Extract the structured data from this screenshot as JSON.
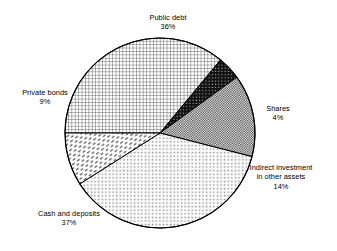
{
  "chart_data": {
    "type": "pie",
    "title": "",
    "subtitle": "",
    "xlabel": "",
    "ylabel": "",
    "legend_position": "none",
    "grid": false,
    "units": "percent",
    "total": 100,
    "categories": [
      "Public debt",
      "Shares",
      "Indirect investment in other assets",
      "Cash and deposits",
      "Private bonds"
    ],
    "values": [
      36,
      4,
      14,
      37,
      9
    ],
    "slices": [
      {
        "id": "public-debt",
        "label": "Public debt",
        "label_lines": [
          "Public debt",
          "36%"
        ],
        "value": 36,
        "value_text": "36%",
        "start_angle_deg": 180,
        "end_angle_deg": 309.6,
        "pattern": "fine-grid-crosshatch",
        "fill": "#ffffff",
        "stroke": "#000000"
      },
      {
        "id": "shares",
        "label": "Shares",
        "label_lines": [
          "Shares",
          "4%"
        ],
        "value": 4,
        "value_text": "4%",
        "start_angle_deg": 309.6,
        "end_angle_deg": 324.0,
        "pattern": "dark-dotted",
        "fill": "#1a1a1a",
        "stroke": "#000000"
      },
      {
        "id": "indirect-investment",
        "label": "Indirect investment in other assets",
        "label_lines": [
          "Indirect investment",
          "in other assets",
          "14%"
        ],
        "value": 14,
        "value_text": "14%",
        "start_angle_deg": 324.0,
        "end_angle_deg": 374.4,
        "pattern": "checkerboard-50",
        "fill": "#7a7a7a",
        "stroke": "#000000"
      },
      {
        "id": "cash-and-deposits",
        "label": "Cash and deposits",
        "label_lines": [
          "Cash and deposits",
          "37%"
        ],
        "value": 37,
        "value_text": "37%",
        "start_angle_deg": 374.4,
        "end_angle_deg": 507.6,
        "pattern": "light-dots",
        "fill": "#ffffff",
        "stroke": "#000000"
      },
      {
        "id": "private-bonds",
        "label": "Private bonds",
        "label_lines": [
          "Private bonds",
          "9%"
        ],
        "value": 9,
        "value_text": "9%",
        "start_angle_deg": 507.6,
        "end_angle_deg": 540,
        "pattern": "diagonal-dashes",
        "fill": "#ffffff",
        "stroke": "#000000"
      }
    ]
  },
  "labels": {
    "public_debt": {
      "name": "Public debt",
      "percent": "36%"
    },
    "private_bonds": {
      "name": "Private bonds",
      "percent": "9%"
    },
    "shares": {
      "name": "Shares",
      "percent": "4%"
    },
    "indirect": {
      "name_line1": "Indirect investment",
      "name_line2": "in other assets",
      "percent": "14%"
    },
    "cash": {
      "name": "Cash and deposits",
      "percent": "37%"
    }
  },
  "colors": {
    "outline": "#000000",
    "background": "#ffffff",
    "shares_fill": "#1a1a1a",
    "indirect_fill": "#7a7a7a"
  }
}
